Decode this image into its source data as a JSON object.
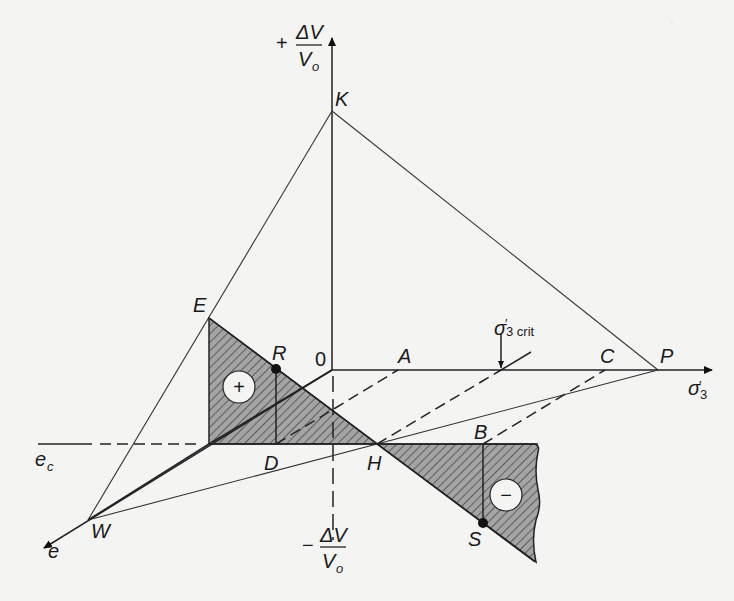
{
  "diagram": {
    "type": "stress-volume-change diagram (soil mechanics)",
    "axes": {
      "vertical_positive": {
        "sign": "+",
        "numerator": "ΔV",
        "denominator": "V",
        "denominator_sub": "o"
      },
      "vertical_negative": {
        "sign": "−",
        "numerator": "ΔV",
        "denominator": "V",
        "denominator_sub": "o"
      },
      "horizontal": {
        "symbol": "σ",
        "prime": "′",
        "sub": "3"
      },
      "oblique": {
        "symbol": "e"
      }
    },
    "points": {
      "K": "K",
      "E": "E",
      "R": "R",
      "origin": "0",
      "A": "A",
      "C": "C",
      "P": "P",
      "D": "D",
      "H": "H",
      "B": "B",
      "S": "S",
      "W": "W"
    },
    "critical_label": {
      "symbol": "σ",
      "prime": "′",
      "sub": "3 crit"
    },
    "ec_label": {
      "symbol": "e",
      "sub": "c"
    },
    "regions": {
      "positive": {
        "sign": "+"
      },
      "negative": {
        "sign": "−"
      }
    },
    "colors": {
      "hatch_fill": "#9a9a9a",
      "line": "#222222",
      "background": "#f4f4f2"
    }
  }
}
